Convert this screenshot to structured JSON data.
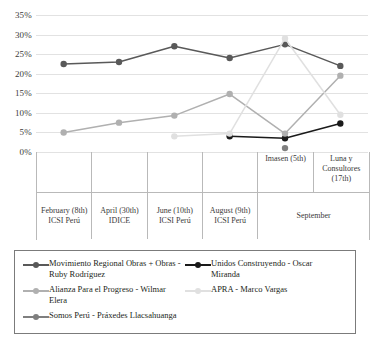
{
  "chart_data": {
    "type": "line",
    "title": "",
    "xlabel": "",
    "ylabel": "",
    "ylim": [
      0,
      35
    ],
    "ytick_labels": [
      "0%",
      "5%",
      "10%",
      "15%",
      "20%",
      "25%",
      "30%",
      "35%"
    ],
    "ytick_values": [
      0,
      5,
      10,
      15,
      20,
      25,
      30,
      35
    ],
    "grid": true,
    "legend_position": "bottom",
    "categories": [
      "February (8th) ICSI Perú",
      "April  (30th) IDICE",
      "June (10th) ICSI Perú",
      "August (9th) ICSI Perú",
      "Imasen (5th)",
      "Luna y Consultores (17th)"
    ],
    "category_groups": [
      {
        "label": "February (8th) ICSI Perú",
        "span": 1,
        "sub": ""
      },
      {
        "label": "April  (30th) IDICE",
        "span": 1,
        "sub": ""
      },
      {
        "label": "June (10th) ICSI Perú",
        "span": 1,
        "sub": ""
      },
      {
        "label": "August (9th) ICSI Perú",
        "span": 1,
        "sub": ""
      },
      {
        "label": "September",
        "span": 2,
        "sub": ""
      }
    ],
    "sub_labels": [
      "",
      "",
      "",
      "",
      "Imasen (5th)",
      "Luna y Consultores (17th)"
    ],
    "series": [
      {
        "name": "Movimiento Regional Obras + Obras - Ruby Rodríguez",
        "color": "#595959",
        "values": [
          22.5,
          23.0,
          27.0,
          24.0,
          27.5,
          22.0
        ]
      },
      {
        "name": "Unidos Construyendo - Oscar Miranda",
        "color": "#1a1a1a",
        "values": [
          null,
          null,
          null,
          4.0,
          3.5,
          7.3
        ]
      },
      {
        "name": "Alianza Para el Progreso - Wilmar Elera",
        "color": "#b0b0b0",
        "values": [
          5.0,
          7.5,
          9.3,
          14.8,
          4.7,
          19.5
        ]
      },
      {
        "name": "APRA - Marco Vargas",
        "color": "#e0e0e0",
        "values": [
          null,
          null,
          4.0,
          4.7,
          29.0,
          9.5
        ]
      },
      {
        "name": "Somos Perú - Práxedes Llacsahuanga",
        "color": "#7f7f7f",
        "values": [
          null,
          null,
          null,
          null,
          1.0,
          null
        ]
      }
    ]
  },
  "legend": {
    "items": [
      {
        "label": "Movimiento Regional Obras + Obras - Ruby Rodríguez",
        "color": "#595959"
      },
      {
        "label": "Unidos Construyendo - Oscar Miranda",
        "color": "#1a1a1a"
      },
      {
        "label": "Alianza Para el Progreso - Wilmar Elera",
        "color": "#b0b0b0"
      },
      {
        "label": "APRA - Marco Vargas",
        "color": "#e0e0e0"
      },
      {
        "label": "Somos Perú - Práxedes Llacsahuanga",
        "color": "#7f7f7f"
      }
    ]
  }
}
